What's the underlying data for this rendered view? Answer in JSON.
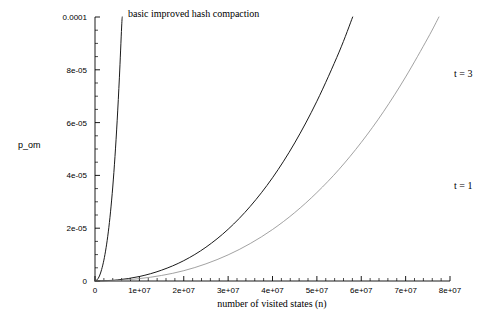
{
  "chart_data": {
    "type": "line",
    "title": "basic improved hash compaction",
    "xlabel": "number of visited states (n)",
    "ylabel": "p_om",
    "xlim": [
      0,
      80000000
    ],
    "ylim": [
      0,
      0.0001
    ],
    "grid": false,
    "legend_position": "inline-right",
    "x_tick_labels": [
      "0",
      "1e+07",
      "2e+07",
      "3e+07",
      "4e+07",
      "5e+07",
      "6e+07",
      "7e+07",
      "8e+07"
    ],
    "x_tick_values": [
      0,
      10000000,
      20000000,
      30000000,
      40000000,
      50000000,
      60000000,
      70000000,
      80000000
    ],
    "y_tick_labels": [
      "0",
      "2e-05",
      "4e-05",
      "6e-05",
      "8e-05",
      "0.0001"
    ],
    "y_tick_values": [
      0,
      2e-05,
      4e-05,
      6e-05,
      8e-05,
      0.0001
    ],
    "x_minor_per_major": 5,
    "y_minor_per_major": 4,
    "series": [
      {
        "name": "basic",
        "label": "",
        "color": "#1a1a1a",
        "width": 1.0,
        "style": "solid",
        "x": [
          0,
          500000,
          1000000,
          1500000,
          2000000,
          2500000,
          3000000,
          3500000,
          4000000,
          4500000,
          5000000,
          5500000,
          6000000,
          6500000,
          7000000
        ],
        "y": [
          0,
          5e-07,
          1.9e-06,
          4.4e-06,
          7.9e-06,
          1.26e-05,
          1.86e-05,
          2.62e-05,
          3.56e-05,
          4.71e-05,
          6.09e-05,
          7.72e-05,
          9.62e-05,
          0.00011,
          0.00013
        ]
      },
      {
        "name": "t = 3",
        "label": "t = 3",
        "color": "#1a1a1a",
        "width": 1.0,
        "style": "solid",
        "x": [
          0,
          5000000,
          10000000,
          15000000,
          20000000,
          25000000,
          30000000,
          35000000,
          40000000,
          45000000,
          50000000,
          55000000,
          60000000,
          65000000,
          70000000,
          75000000,
          78000000
        ],
        "y": [
          0,
          4e-07,
          1.7e-06,
          4.1e-06,
          7.7e-06,
          1.28e-05,
          1.96e-05,
          2.83e-05,
          3.91e-05,
          5.23e-05,
          6.81e-05,
          8.67e-05,
          0.0001084,
          0.0001334,
          0.000162,
          0.0001944,
          0.0002156
        ]
      },
      {
        "name": "t = 1",
        "label": "t = 1",
        "color": "#8a8a8a",
        "width": 0.8,
        "style": "solid",
        "x": [
          0,
          5000000,
          10000000,
          15000000,
          20000000,
          25000000,
          30000000,
          35000000,
          40000000,
          45000000,
          50000000,
          55000000,
          60000000,
          65000000,
          70000000,
          75000000,
          78000000
        ],
        "y": [
          0,
          2e-07,
          9e-07,
          2.1e-06,
          3.9e-06,
          6.5e-06,
          9.9e-06,
          1.42e-05,
          1.95e-05,
          2.59e-05,
          3.35e-05,
          4.23e-05,
          5.25e-05,
          6.41e-05,
          7.73e-05,
          9.2e-05,
          0.0001016
        ]
      }
    ],
    "annotations": [
      {
        "text": "t = 3",
        "x": 80000000,
        "y": 7.833e-05
      },
      {
        "text": "t = 1",
        "x": 80000000,
        "y": 3.59e-05
      }
    ]
  }
}
